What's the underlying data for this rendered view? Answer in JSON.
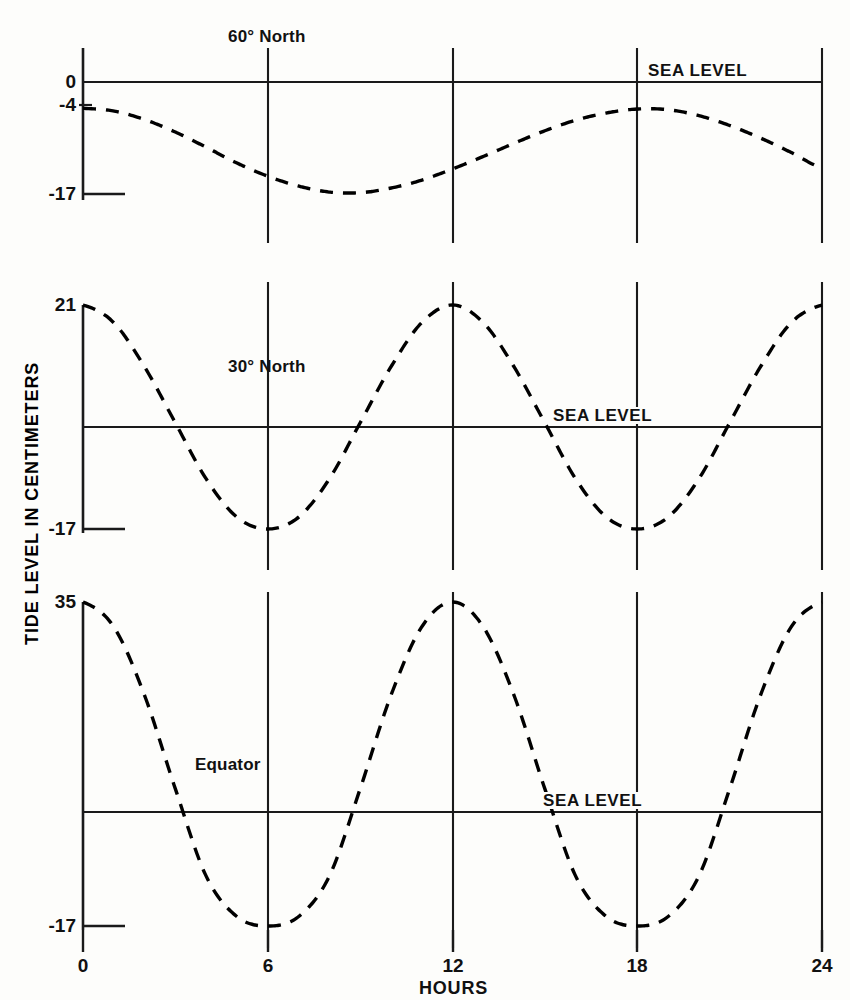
{
  "chart_data": {
    "type": "line",
    "title": "",
    "xlabel": "HOURS",
    "ylabel": "TIDE LEVEL IN CENTIMETERS",
    "xlim": [
      0,
      24
    ],
    "xticks": [
      0,
      6,
      12,
      18,
      24
    ],
    "xtick_labels": [
      "0",
      "6",
      "12",
      "18",
      "24"
    ],
    "grid": "vertical gridlines at 6, 12, 18",
    "legend": "none (panels labeled in-place)",
    "line_style": "dashed",
    "line_color": "#000000",
    "reference_line_label": "SEA LEVEL",
    "panels": [
      {
        "name": "60° North",
        "label": "60° North",
        "sea_level_label": "SEA LEVEL",
        "ytick_labels": [
          "0",
          "-4",
          "-17"
        ],
        "ytick_values": [
          0,
          -4,
          -17
        ],
        "ylim": [
          -17,
          0
        ],
        "x": [
          0,
          1,
          2,
          3,
          4,
          5,
          6,
          7,
          8,
          9,
          10,
          11,
          12,
          13,
          14,
          15,
          16,
          17,
          18,
          19,
          20,
          21,
          22,
          23,
          24
        ],
        "values": [
          -4,
          -4.4,
          -5.7,
          -7.6,
          -9.9,
          -12.3,
          -14.3,
          -15.8,
          -16.7,
          -16.8,
          -16.1,
          -14.9,
          -13.2,
          -11.3,
          -9.3,
          -7.4,
          -5.8,
          -4.7,
          -4.1,
          -4.2,
          -5.1,
          -6.6,
          -8.5,
          -10.7,
          -13.0
        ]
      },
      {
        "name": "30° North",
        "label": "30° North",
        "sea_level_label": "SEA LEVEL",
        "ytick_labels": [
          "21",
          "-17"
        ],
        "ytick_values": [
          21,
          -17
        ],
        "ylim": [
          -17,
          21
        ],
        "x": [
          0,
          1,
          2,
          3,
          4,
          5,
          6,
          7,
          8,
          9,
          10,
          11,
          12,
          13,
          14,
          15,
          16,
          17,
          18,
          19,
          20,
          21,
          22,
          23,
          24
        ],
        "values": [
          21,
          18.0,
          10.5,
          1.0,
          -8.5,
          -15.0,
          -17.0,
          -15.0,
          -8.5,
          1.0,
          10.5,
          18.0,
          21,
          18.0,
          10.5,
          1.0,
          -8.5,
          -15.0,
          -17.0,
          -15.0,
          -8.5,
          1.0,
          10.5,
          18.0,
          21
        ]
      },
      {
        "name": "Equator",
        "label": "Equator",
        "sea_level_label": "SEA LEVEL",
        "ytick_labels": [
          "35",
          "-17"
        ],
        "ytick_values": [
          35,
          -17
        ],
        "ylim": [
          -17,
          35
        ],
        "x": [
          0,
          1,
          2,
          3,
          4,
          5,
          6,
          7,
          8,
          9,
          10,
          11,
          12,
          13,
          14,
          15,
          16,
          17,
          18,
          19,
          20,
          21,
          22,
          23,
          24
        ],
        "values": [
          35,
          31.0,
          20.0,
          5.0,
          -9.0,
          -15.5,
          -17.0,
          -15.5,
          -9.0,
          5.0,
          20.0,
          31.0,
          35,
          31.0,
          20.0,
          5.0,
          -9.0,
          -15.5,
          -17.0,
          -15.5,
          -9.0,
          5.0,
          20.0,
          31.0,
          35
        ]
      }
    ]
  },
  "axes": {
    "y_axis_title": "TIDE LEVEL IN CENTIMETERS",
    "x_axis_title": "HOURS"
  },
  "ticks": {
    "x": [
      "0",
      "6",
      "12",
      "18",
      "24"
    ],
    "panel1_y": [
      "0",
      "-4",
      "-17"
    ],
    "panel2_y": [
      "21",
      "-17"
    ],
    "panel3_y": [
      "35",
      "-17"
    ]
  },
  "labels": {
    "panel1_title": "60° North",
    "panel2_title": "30° North",
    "panel3_title": "Equator",
    "sea_level_1": "SEA LEVEL",
    "sea_level_2": "SEA LEVEL",
    "sea_level_3": "SEA LEVEL"
  },
  "colors": {
    "line": "#000000",
    "axis": "#1a1a1a",
    "background": "#fdfdfb"
  }
}
